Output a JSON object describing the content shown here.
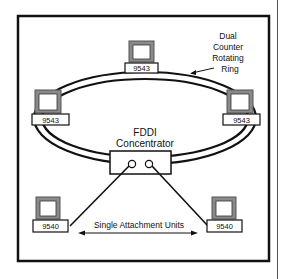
{
  "diagram": {
    "ring_label": [
      "Dual",
      "Counter",
      "Rotating",
      "Ring"
    ],
    "concentrator_label": [
      "FDDI",
      "Concentrator"
    ],
    "sau_label": "Single Attachment Units",
    "ring_stations": [
      {
        "id": "top",
        "model": "9543"
      },
      {
        "id": "left",
        "model": "9543"
      },
      {
        "id": "right",
        "model": "9543"
      }
    ],
    "single_units": [
      {
        "id": "left",
        "model": "9540"
      },
      {
        "id": "right",
        "model": "9540"
      }
    ],
    "colors": {
      "line": "#111111",
      "monitor_shade": "#8a8a8a",
      "background": "#ffffff"
    }
  }
}
